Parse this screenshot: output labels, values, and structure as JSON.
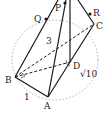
{
  "diagram": {
    "type": "3d-geometry-figure",
    "points": {
      "P": {
        "label": "P",
        "x": 65,
        "y": 3
      },
      "Q": {
        "label": "Q",
        "x": 46,
        "y": 19
      },
      "R": {
        "label": "R",
        "x": 90,
        "y": 14
      },
      "C": {
        "label": "C",
        "x": 94,
        "y": 24
      },
      "B": {
        "label": "B",
        "x": 15,
        "y": 77
      },
      "D": {
        "label": "D",
        "x": 70,
        "y": 62
      },
      "A": {
        "label": "A",
        "x": 48,
        "y": 97
      }
    },
    "edge_labels": {
      "BC": "3",
      "AB": "1",
      "CD": "√10"
    },
    "colors": {
      "line": "#1a1a1a",
      "circle": "#999999"
    }
  }
}
